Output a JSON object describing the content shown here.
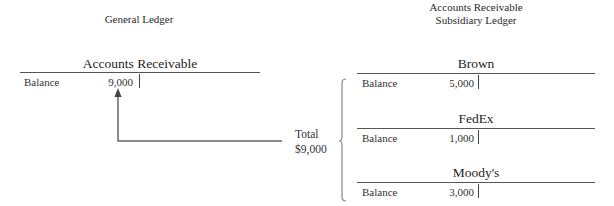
{
  "general_ledger": {
    "heading": "General Ledger",
    "account": {
      "title": "Accounts Receivable",
      "row_label": "Balance",
      "amount": "9,000"
    }
  },
  "subsidiary_ledger": {
    "heading_line1": "Accounts Receivable",
    "heading_line2": "Subsidiary Ledger",
    "accounts": [
      {
        "title": "Brown",
        "row_label": "Balance",
        "amount": "5,000"
      },
      {
        "title": "FedEx",
        "row_label": "Balance",
        "amount": "1,000"
      },
      {
        "title": "Moody's",
        "row_label": "Balance",
        "amount": "3,000"
      }
    ]
  },
  "total": {
    "label": "Total",
    "amount": "$9,000"
  },
  "colors": {
    "line": "#555555",
    "connector": "#666666",
    "bracket": "#888888",
    "text": "#2a2a2a"
  }
}
